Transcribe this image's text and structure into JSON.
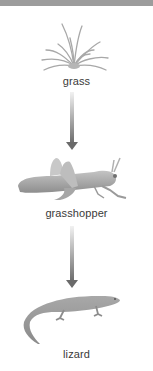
{
  "diagram": {
    "type": "food-chain",
    "nodes": [
      {
        "id": "grass",
        "label": "grass",
        "icon": "grass-icon"
      },
      {
        "id": "grasshopper",
        "label": "grasshopper",
        "icon": "grasshopper-icon"
      },
      {
        "id": "lizard",
        "label": "lizard",
        "icon": "lizard-icon"
      }
    ],
    "edges": [
      {
        "from": "grass",
        "to": "grasshopper"
      },
      {
        "from": "grasshopper",
        "to": "lizard"
      }
    ],
    "colors": {
      "top_bar": "#9c9c9c",
      "arrow_dark": "#6a6a6a",
      "arrow_light": "#f2f2f2",
      "label_text": "#3a3a3a",
      "illustration": "#9a9a9a"
    }
  }
}
